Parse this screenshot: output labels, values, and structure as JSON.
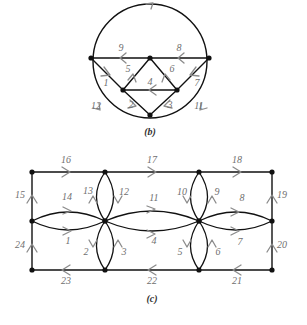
{
  "figure": {
    "background_color": "#ffffff",
    "edge_color": "#111111",
    "arrow_color": "#8b8b8b",
    "label_color": "#6f6f6f",
    "panels": [
      {
        "id": "b",
        "caption": "(b)",
        "caption_pos": {
          "x": 150,
          "y": 133
        },
        "description": "Circle with inscribed chords and triangles, 12 numbered directed edges",
        "vertices": [
          {
            "name": "left",
            "x": 91,
            "y": 58
          },
          {
            "name": "top-center",
            "x": 150,
            "y": 58
          },
          {
            "name": "right",
            "x": 209,
            "y": 58
          },
          {
            "name": "mid-left",
            "x": 123,
            "y": 90
          },
          {
            "name": "mid-right",
            "x": 177,
            "y": 90
          },
          {
            "name": "bottom",
            "x": 150,
            "y": 115
          }
        ],
        "edge_labels": [
          {
            "id": "1",
            "x": 106,
            "y": 84
          },
          {
            "id": "2",
            "x": 131,
            "y": 106
          },
          {
            "id": "3",
            "x": 170,
            "y": 106
          },
          {
            "id": "4",
            "x": 150,
            "y": 83
          },
          {
            "id": "5",
            "x": 128,
            "y": 70
          },
          {
            "id": "6",
            "x": 172,
            "y": 70
          },
          {
            "id": "7",
            "x": 197,
            "y": 84
          },
          {
            "id": "8",
            "x": 179,
            "y": 49
          },
          {
            "id": "9",
            "x": 121,
            "y": 49
          },
          {
            "id": "11",
            "x": 199,
            "y": 107
          },
          {
            "id": "12",
            "x": 96,
            "y": 107
          }
        ]
      },
      {
        "id": "c",
        "caption": "(c)",
        "caption_pos": {
          "x": 152,
          "y": 300
        },
        "description": "Rectangle with two petal clusters, 24 numbered directed edges",
        "vertices": [
          {
            "name": "top-left",
            "x": 32,
            "y": 172
          },
          {
            "name": "top-mid-left",
            "x": 105,
            "y": 172
          },
          {
            "name": "top-mid-right",
            "x": 199,
            "y": 172
          },
          {
            "name": "top-right",
            "x": 272,
            "y": 172
          },
          {
            "name": "mid-left",
            "x": 32,
            "y": 221
          },
          {
            "name": "center-left",
            "x": 105,
            "y": 221
          },
          {
            "name": "center-right",
            "x": 199,
            "y": 221
          },
          {
            "name": "mid-right",
            "x": 272,
            "y": 221
          },
          {
            "name": "bottom-left",
            "x": 32,
            "y": 270
          },
          {
            "name": "bottom-mid-left",
            "x": 105,
            "y": 270
          },
          {
            "name": "bottom-mid-right",
            "x": 199,
            "y": 270
          },
          {
            "name": "bottom-right",
            "x": 272,
            "y": 270
          }
        ],
        "edge_labels": [
          {
            "id": "1",
            "x": 68,
            "y": 242
          },
          {
            "id": "2",
            "x": 86,
            "y": 253
          },
          {
            "id": "3",
            "x": 124,
            "y": 253
          },
          {
            "id": "4",
            "x": 154,
            "y": 242
          },
          {
            "id": "5",
            "x": 180,
            "y": 253
          },
          {
            "id": "6",
            "x": 218,
            "y": 253
          },
          {
            "id": "7",
            "x": 240,
            "y": 243
          },
          {
            "id": "8",
            "x": 242,
            "y": 199
          },
          {
            "id": "9",
            "x": 217,
            "y": 193
          },
          {
            "id": "10",
            "x": 182,
            "y": 193
          },
          {
            "id": "11",
            "x": 154,
            "y": 199
          },
          {
            "id": "12",
            "x": 124,
            "y": 193
          },
          {
            "id": "13",
            "x": 88,
            "y": 192
          },
          {
            "id": "14",
            "x": 67,
            "y": 198
          },
          {
            "id": "15",
            "x": 20,
            "y": 196
          },
          {
            "id": "16",
            "x": 66,
            "y": 161
          },
          {
            "id": "17",
            "x": 152,
            "y": 161
          },
          {
            "id": "18",
            "x": 237,
            "y": 161
          },
          {
            "id": "19",
            "x": 282,
            "y": 196
          },
          {
            "id": "20",
            "x": 282,
            "y": 246
          },
          {
            "id": "21",
            "x": 237,
            "y": 282
          },
          {
            "id": "22",
            "x": 152,
            "y": 282
          },
          {
            "id": "23",
            "x": 66,
            "y": 282
          },
          {
            "id": "24",
            "x": 20,
            "y": 246
          }
        ]
      }
    ]
  }
}
